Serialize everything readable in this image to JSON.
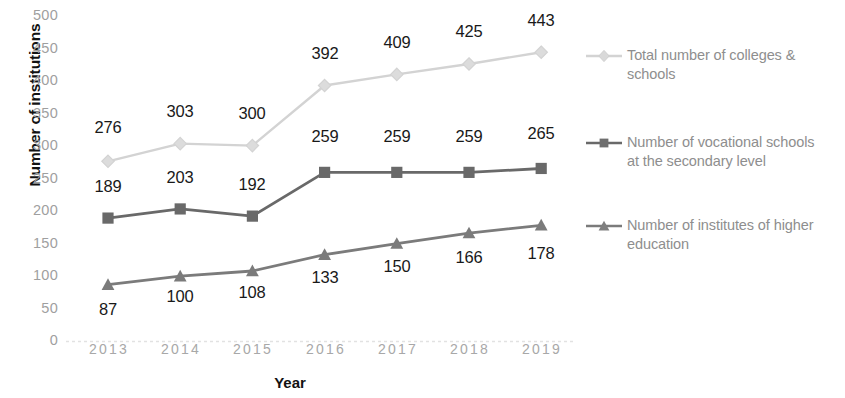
{
  "chart_data": {
    "type": "line",
    "title": "",
    "xlabel": "Year",
    "ylabel": "Number of institutions",
    "categories": [
      "2013",
      "2014",
      "2015",
      "2016",
      "2017",
      "2018",
      "2019"
    ],
    "ylim": [
      0,
      500
    ],
    "yticks": [
      0,
      50,
      100,
      150,
      200,
      250,
      300,
      350,
      400,
      450,
      500
    ],
    "grid": false,
    "legend_position": "right",
    "series": [
      {
        "name": "Total number of colleges & schools",
        "marker": "diamond",
        "color": "#d3d3d3",
        "values": [
          276,
          303,
          300,
          392,
          409,
          425,
          443
        ],
        "label_position": "above"
      },
      {
        "name": "Number of vocational schools at the secondary level",
        "marker": "square",
        "color": "#696969",
        "values": [
          189,
          203,
          192,
          259,
          259,
          259,
          265
        ],
        "label_position": "above"
      },
      {
        "name": "Number of institutes of higher education",
        "marker": "triangle",
        "color": "#7b7b7b",
        "values": [
          87,
          100,
          108,
          133,
          150,
          166,
          178
        ],
        "label_position": "below"
      }
    ]
  },
  "axes": {
    "y_tick_labels": [
      "500",
      "450",
      "400",
      "350",
      "300",
      "250",
      "200",
      "150",
      "100",
      "50",
      "0"
    ],
    "x_tick_labels": [
      "2013",
      "2014",
      "2015",
      "2016",
      "2017",
      "2018",
      "2019"
    ],
    "y_axis_title": "Number of institutions",
    "x_axis_title": "Year"
  },
  "legend": {
    "items": [
      {
        "line1": "Total number of colleges &",
        "line2": "schools",
        "marker": "diamond-marker",
        "color": "#d3d3d3"
      },
      {
        "line1": "Number of vocational schools",
        "line2": "at the secondary level",
        "marker": "square-marker",
        "color": "#696969"
      },
      {
        "line1": "Number of institutes of higher",
        "line2": "education",
        "marker": "triangle-marker",
        "color": "#7b7b7b"
      }
    ]
  },
  "data_labels": {
    "total": [
      "276",
      "303",
      "300",
      "392",
      "409",
      "425",
      "443"
    ],
    "vocational": [
      "189",
      "203",
      "192",
      "259",
      "259",
      "259",
      "265"
    ],
    "higher": [
      "87",
      "100",
      "108",
      "133",
      "150",
      "166",
      "178"
    ]
  }
}
